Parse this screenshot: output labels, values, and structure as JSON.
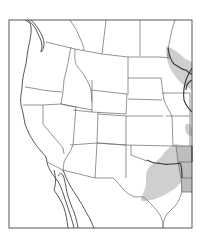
{
  "map": {
    "type": "species-range-map",
    "region": "Western United States and northern Mexico",
    "colors": {
      "background": "#ffffff",
      "borders": "#666666",
      "range_fill": "#cfcfcf",
      "range_fill_dark": "#bdbdbd"
    },
    "range_areas": [
      {
        "name": "upper-midwest-range",
        "location": "Minnesota / western Wisconsin along the Mississippi"
      },
      {
        "name": "southern-plains-range",
        "location": "Oklahoma, east Texas, Arkansas, Louisiana"
      },
      {
        "name": "missouri-range",
        "location": "small patch in Missouri"
      }
    ],
    "labels": []
  }
}
